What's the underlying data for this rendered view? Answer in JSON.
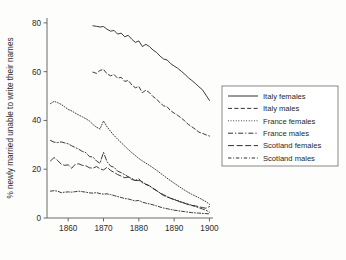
{
  "chart_data": {
    "type": "line",
    "title": "",
    "subtitle": "",
    "xlabel": "",
    "ylabel": "% newly married unable to write their names",
    "xlim": [
      1854,
      1901
    ],
    "ylim": [
      0,
      82
    ],
    "grid": false,
    "legend_position": "right",
    "xticks": [
      "1860",
      "1870",
      "1880",
      "1890",
      "1900"
    ],
    "xtick_values": [
      1860,
      1870,
      1880,
      1890,
      1900
    ],
    "yticks": [
      "0",
      "20",
      "40",
      "60",
      "80"
    ],
    "ytick_values": [
      0,
      20,
      40,
      60,
      80
    ],
    "series": [
      {
        "name": "Italy females",
        "style": "solid",
        "x": [
          1867,
          1868,
          1869,
          1870,
          1871,
          1872,
          1873,
          1874,
          1875,
          1876,
          1877,
          1878,
          1879,
          1880,
          1881,
          1882,
          1883,
          1884,
          1885,
          1886,
          1887,
          1888,
          1889,
          1890,
          1891,
          1892,
          1893,
          1894,
          1895,
          1896,
          1897,
          1898,
          1899,
          1900
        ],
        "values": [
          78.8,
          78.6,
          78.3,
          78.5,
          77.4,
          76.6,
          76.9,
          75.4,
          75.8,
          74.3,
          74.9,
          73.3,
          72.0,
          72.6,
          70.3,
          71.2,
          70.3,
          68.9,
          67.9,
          66.4,
          65.2,
          64.8,
          63.3,
          62.3,
          61.4,
          60.2,
          59.0,
          57.5,
          56.4,
          55.2,
          53.8,
          52.6,
          50.4,
          48.2
        ]
      },
      {
        "name": "Italy males",
        "style": "dashed",
        "x": [
          1867,
          1868,
          1869,
          1870,
          1871,
          1872,
          1873,
          1874,
          1875,
          1876,
          1877,
          1878,
          1879,
          1880,
          1881,
          1882,
          1883,
          1884,
          1885,
          1886,
          1887,
          1888,
          1889,
          1890,
          1891,
          1892,
          1893,
          1894,
          1895,
          1896,
          1897,
          1898,
          1899,
          1900
        ],
        "values": [
          59.8,
          59.3,
          60.5,
          60.9,
          59.1,
          58.3,
          58.8,
          57.3,
          57.7,
          56.0,
          56.4,
          54.6,
          53.4,
          53.9,
          51.4,
          52.4,
          51.4,
          49.8,
          48.8,
          47.2,
          46.0,
          45.6,
          44.0,
          43.0,
          42.1,
          41.0,
          39.8,
          38.4,
          37.4,
          36.4,
          35.2,
          34.7,
          34.1,
          33.6
        ]
      },
      {
        "name": "France females",
        "style": "dotted",
        "x": [
          1855,
          1856,
          1857,
          1858,
          1859,
          1860,
          1861,
          1862,
          1863,
          1864,
          1865,
          1866,
          1867,
          1868,
          1869,
          1870,
          1871,
          1872,
          1873,
          1874,
          1875,
          1876,
          1877,
          1878,
          1879,
          1880,
          1881,
          1882,
          1883,
          1884,
          1885,
          1886,
          1887,
          1888,
          1889,
          1890,
          1891,
          1892,
          1893,
          1894,
          1895,
          1896,
          1897,
          1898,
          1899,
          1900
        ],
        "values": [
          46.9,
          47.8,
          47.3,
          46.6,
          45.6,
          44.5,
          43.9,
          43.0,
          42.2,
          41.5,
          40.7,
          39.8,
          38.4,
          37.2,
          36.5,
          39.8,
          37.4,
          35.5,
          33.8,
          32.3,
          30.9,
          29.5,
          28.1,
          26.8,
          25.6,
          24.4,
          23.4,
          22.5,
          21.6,
          20.6,
          19.6,
          18.5,
          17.4,
          16.3,
          15.3,
          14.3,
          13.3,
          12.3,
          11.4,
          10.5,
          9.7,
          9.0,
          8.3,
          7.5,
          6.7,
          5.6
        ]
      },
      {
        "name": "France males",
        "style": "dashdot",
        "x": [
          1855,
          1856,
          1857,
          1858,
          1859,
          1860,
          1861,
          1862,
          1863,
          1864,
          1865,
          1866,
          1867,
          1868,
          1869,
          1870,
          1871,
          1872,
          1873,
          1874,
          1875,
          1876,
          1877,
          1878,
          1879,
          1880,
          1881,
          1882,
          1883,
          1884,
          1885,
          1886,
          1887,
          1888,
          1889,
          1890,
          1891,
          1892,
          1893,
          1894,
          1895,
          1896,
          1897,
          1898,
          1899,
          1900
        ],
        "values": [
          31.8,
          31.1,
          30.9,
          31.2,
          30.8,
          30.4,
          29.6,
          28.9,
          28.2,
          27.3,
          26.8,
          25.2,
          25.0,
          23.4,
          22.4,
          26.9,
          23.1,
          21.3,
          20.8,
          19.2,
          18.6,
          17.8,
          16.9,
          16.2,
          15.4,
          15.4,
          14.9,
          13.8,
          13.2,
          12.1,
          11.2,
          10.3,
          9.6,
          8.8,
          8.1,
          7.6,
          7.2,
          6.6,
          6.1,
          5.7,
          5.2,
          4.7,
          4.2,
          3.7,
          3.2,
          2.4
        ]
      },
      {
        "name": "Scotland females",
        "style": "longdash",
        "x": [
          1855,
          1856,
          1857,
          1858,
          1859,
          1860,
          1861,
          1862,
          1863,
          1864,
          1865,
          1866,
          1867,
          1868,
          1869,
          1870,
          1871,
          1872,
          1873,
          1874,
          1875,
          1876,
          1877,
          1878,
          1879,
          1880,
          1881,
          1882,
          1883,
          1884,
          1885,
          1886,
          1887,
          1888,
          1889,
          1890,
          1891,
          1892,
          1893,
          1894,
          1895,
          1896,
          1897,
          1898,
          1899,
          1900
        ],
        "values": [
          23.4,
          24.8,
          23.6,
          22.1,
          21.6,
          21.8,
          20.4,
          22.0,
          22.2,
          21.6,
          21.4,
          20.6,
          20.4,
          21.1,
          20.2,
          19.7,
          20.8,
          19.5,
          18.7,
          17.8,
          17.2,
          16.5,
          16.8,
          15.8,
          15.4,
          16.1,
          14.4,
          13.8,
          13.2,
          12.2,
          11.3,
          10.2,
          9.2,
          8.6,
          8.1,
          7.5,
          7.0,
          6.4,
          6.0,
          5.5,
          5.1,
          5.0,
          4.6,
          4.3,
          4.0,
          4.7
        ]
      },
      {
        "name": "Scotland males",
        "style": "shortdashdot",
        "x": [
          1855,
          1856,
          1857,
          1858,
          1859,
          1860,
          1861,
          1862,
          1863,
          1864,
          1865,
          1866,
          1867,
          1868,
          1869,
          1870,
          1871,
          1872,
          1873,
          1874,
          1875,
          1876,
          1877,
          1878,
          1879,
          1880,
          1881,
          1882,
          1883,
          1884,
          1885,
          1886,
          1887,
          1888,
          1889,
          1890,
          1891,
          1892,
          1893,
          1894,
          1895,
          1896,
          1897,
          1898,
          1899,
          1900
        ],
        "values": [
          11.0,
          11.2,
          11.0,
          10.4,
          10.6,
          10.7,
          10.6,
          10.8,
          11.0,
          10.8,
          10.6,
          10.3,
          10.2,
          10.4,
          10.0,
          9.8,
          9.9,
          9.6,
          9.2,
          8.8,
          8.4,
          8.0,
          7.8,
          7.4,
          7.0,
          7.2,
          6.5,
          6.1,
          5.8,
          5.4,
          5.0,
          4.5,
          4.1,
          3.8,
          3.5,
          3.2,
          3.0,
          2.8,
          2.6,
          2.4,
          2.2,
          2.1,
          2.0,
          1.9,
          1.8,
          1.7
        ]
      }
    ]
  },
  "legend": {
    "items": [
      {
        "label": "Italy females",
        "style": "solid"
      },
      {
        "label": "Italy males",
        "style": "dashed"
      },
      {
        "label": "France females",
        "style": "dotted"
      },
      {
        "label": "France males",
        "style": "dashdot"
      },
      {
        "label": "Scotland females",
        "style": "longdash"
      },
      {
        "label": "Scotland males",
        "style": "shortdashdot"
      }
    ]
  },
  "colors": {
    "line": "#1a1a1a",
    "axis": "#5a5a5a",
    "text": "#2b2b2b",
    "background": "#fdfdfc",
    "legend_border": "#6b6b6b"
  }
}
